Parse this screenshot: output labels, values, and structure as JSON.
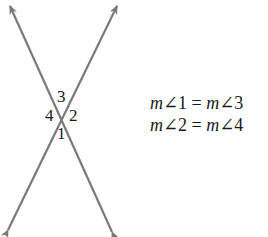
{
  "figure": {
    "type": "intersecting-lines",
    "line_color": "#7a7a7a",
    "lines": [
      {
        "name": "line-a",
        "from": [
          112,
          232
        ],
        "to": [
          10,
          6
        ]
      },
      {
        "name": "line-b",
        "from": [
          8,
          230
        ],
        "to": [
          117,
          6
        ]
      }
    ],
    "intersection": [
      63,
      117
    ],
    "angle_labels": [
      {
        "id": "3",
        "text": "3",
        "x": 57,
        "y": 88
      },
      {
        "id": "4",
        "text": "4",
        "x": 45,
        "y": 107
      },
      {
        "id": "2",
        "text": "2",
        "x": 69,
        "y": 107
      },
      {
        "id": "1",
        "text": "1",
        "x": 57,
        "y": 125
      }
    ]
  },
  "equations": [
    {
      "lhs_m": "m",
      "lhs_angle": "∠1",
      "equals": " = ",
      "rhs_m": "m",
      "rhs_angle": "∠3"
    },
    {
      "lhs_m": "m",
      "lhs_angle": "∠2",
      "equals": " = ",
      "rhs_m": "m",
      "rhs_angle": "∠4"
    }
  ]
}
